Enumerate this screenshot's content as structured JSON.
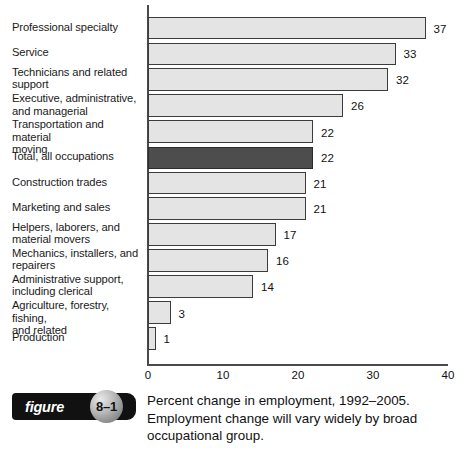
{
  "chart_data": {
    "type": "bar",
    "orientation": "horizontal",
    "title": "",
    "xlabel": "",
    "ylabel": "",
    "xlim": [
      0,
      40
    ],
    "xticks": [
      0,
      10,
      20,
      30,
      40
    ],
    "xtick_labels": [
      "0",
      "10",
      "20",
      "30",
      "40"
    ],
    "grid": false,
    "legend": false,
    "highlight_category": "Total, all occupations",
    "highlight_color": "#4d4d4d",
    "bar_color": "#e4e4e4",
    "bar_border_color": "#3c3c3c",
    "categories": [
      "Professional specialty",
      "Service",
      "Technicians and related support",
      "Executive, administrative, and managerial",
      "Transportation and material moving",
      "Total, all occupations",
      "Construction trades",
      "Marketing and sales",
      "Helpers, laborers, and material movers",
      "Mechanics, installers, and repairers",
      "Administrative support, including clerical",
      "Agriculture, forestry, fishing, and related",
      "Production"
    ],
    "values": [
      37,
      33,
      32,
      26,
      22,
      22,
      21,
      21,
      17,
      16,
      14,
      3,
      1
    ],
    "value_labels": [
      "37",
      "33",
      "32",
      "26",
      "22",
      "22",
      "21",
      "21",
      "17",
      "16",
      "14",
      "3",
      "1"
    ],
    "rows": [
      {
        "label_lines": [
          "Professional specialty"
        ],
        "value": 37,
        "value_label": "37",
        "highlight": false
      },
      {
        "label_lines": [
          "Service"
        ],
        "value": 33,
        "value_label": "33",
        "highlight": false
      },
      {
        "label_lines": [
          "Technicians and related",
          "support"
        ],
        "value": 32,
        "value_label": "32",
        "highlight": false
      },
      {
        "label_lines": [
          "Executive, administrative,",
          "and managerial"
        ],
        "value": 26,
        "value_label": "26",
        "highlight": false
      },
      {
        "label_lines": [
          "Transportation and material",
          "moving"
        ],
        "value": 22,
        "value_label": "22",
        "highlight": false
      },
      {
        "label_lines": [
          "Total, all occupations"
        ],
        "value": 22,
        "value_label": "22",
        "highlight": true
      },
      {
        "label_lines": [
          "Construction trades"
        ],
        "value": 21,
        "value_label": "21",
        "highlight": false
      },
      {
        "label_lines": [
          "Marketing and sales"
        ],
        "value": 21,
        "value_label": "21",
        "highlight": false
      },
      {
        "label_lines": [
          "Helpers, laborers, and",
          "material movers"
        ],
        "value": 17,
        "value_label": "17",
        "highlight": false
      },
      {
        "label_lines": [
          "Mechanics, installers, and",
          "repairers"
        ],
        "value": 16,
        "value_label": "16",
        "highlight": false
      },
      {
        "label_lines": [
          "Administrative support,",
          "including clerical"
        ],
        "value": 14,
        "value_label": "14",
        "highlight": false
      },
      {
        "label_lines": [
          "Agriculture, forestry, fishing,",
          "and related"
        ],
        "value": 3,
        "value_label": "3",
        "highlight": false
      },
      {
        "label_lines": [
          "Production"
        ],
        "value": 1,
        "value_label": "1",
        "highlight": false
      }
    ]
  },
  "figure": {
    "badge_word": "figure",
    "badge_number": "8–1",
    "caption_lines": [
      "Percent change in employment, 1992–2005.",
      "Employment change will vary widely by broad",
      "occupational group."
    ]
  }
}
